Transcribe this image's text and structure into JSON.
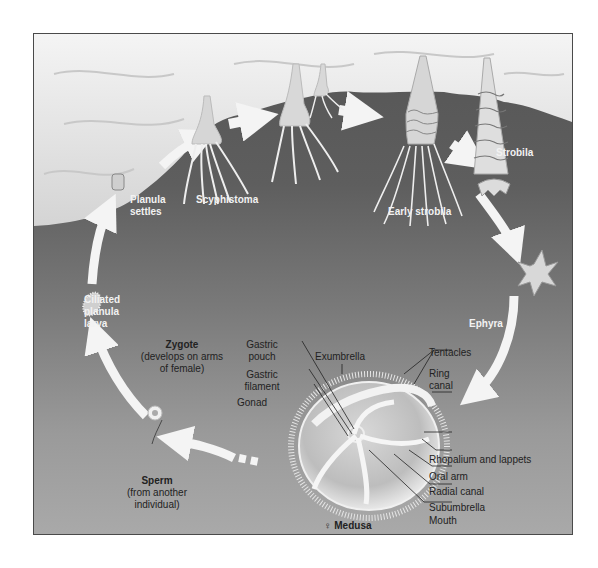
{
  "diagram": {
    "stages": {
      "planula_settles": [
        "Planula",
        "settles"
      ],
      "scyphistoma": "Scyphistoma",
      "early_strobila": "Early strobila",
      "strobila": "Strobila",
      "ephyra": "Ephyra",
      "medusa_symbol": "♀",
      "medusa": "Medusa",
      "ciliated_planula": [
        "Ciliated",
        "planula",
        "larva"
      ],
      "zygote": "Zygote",
      "zygote_note": [
        "(develops on arms",
        "of female)"
      ],
      "sperm": "Sperm",
      "sperm_note": [
        "(from another",
        "individual)"
      ]
    },
    "medusa_parts": {
      "left": {
        "gastric_pouch": [
          "Gastric",
          "pouch"
        ],
        "gastric_filament": [
          "Gastric",
          "filament"
        ],
        "gonad": "Gonad"
      },
      "top": {
        "exumbrella": "Exumbrella"
      },
      "right": {
        "tentacles": "Tentacles",
        "ring_canal": [
          "Ring",
          "canal"
        ],
        "rhopalium": "Rhopalium and lappets",
        "oral_arm": "Oral arm",
        "radial_canal": "Radial canal",
        "subumbrella": "Subumbrella",
        "mouth": "Mouth"
      }
    },
    "colors": {
      "background_top": "#555555",
      "background_bottom": "#a9a9a9",
      "rock": "#e6e6e6",
      "arrow": "#f4f4f4",
      "stage_label": "#f2f2f2",
      "part_label": "#222222"
    }
  }
}
